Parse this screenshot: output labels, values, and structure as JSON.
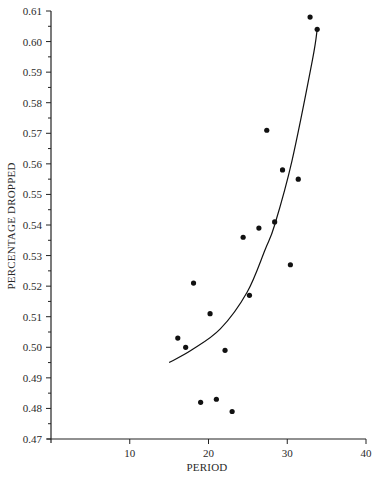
{
  "chart_data": {
    "type": "scatter",
    "title": "",
    "xlabel": "PERIOD",
    "ylabel": "PERCENTAGE DROPPED",
    "xlim": [
      0,
      40
    ],
    "ylim": [
      0.47,
      0.61
    ],
    "x_ticks": [
      10,
      20,
      30,
      40
    ],
    "x_tick_labels": [
      "10",
      "20",
      "30",
      "40"
    ],
    "y_ticks": [
      0.47,
      0.48,
      0.49,
      0.5,
      0.51,
      0.52,
      0.53,
      0.54,
      0.55,
      0.56,
      0.57,
      0.58,
      0.59,
      0.6,
      0.61
    ],
    "y_tick_labels": [
      "0.47",
      "0.48",
      "0.49",
      "0.50",
      "0.51",
      "0.52",
      "0.53",
      "0.54",
      "0.55",
      "0.56",
      "0.57",
      "0.58",
      "0.59",
      "0.60",
      "0.61"
    ],
    "y_minor_step": 0.005,
    "grid": false,
    "legend": null,
    "series": [
      {
        "name": "observations",
        "type": "scatter",
        "color": "#111111",
        "points": [
          {
            "x": 16.1,
            "y": 0.503
          },
          {
            "x": 17.1,
            "y": 0.5
          },
          {
            "x": 18.1,
            "y": 0.521
          },
          {
            "x": 19.0,
            "y": 0.482
          },
          {
            "x": 20.2,
            "y": 0.511
          },
          {
            "x": 21.0,
            "y": 0.483
          },
          {
            "x": 22.1,
            "y": 0.499
          },
          {
            "x": 23.0,
            "y": 0.479
          },
          {
            "x": 24.4,
            "y": 0.536
          },
          {
            "x": 25.2,
            "y": 0.517
          },
          {
            "x": 26.4,
            "y": 0.539
          },
          {
            "x": 27.4,
            "y": 0.571
          },
          {
            "x": 28.4,
            "y": 0.541
          },
          {
            "x": 29.4,
            "y": 0.558
          },
          {
            "x": 30.4,
            "y": 0.527
          },
          {
            "x": 31.4,
            "y": 0.555
          },
          {
            "x": 32.9,
            "y": 0.608
          },
          {
            "x": 33.8,
            "y": 0.604
          }
        ]
      },
      {
        "name": "fitted curve",
        "type": "line",
        "color": "#111111",
        "points": [
          {
            "x": 15.0,
            "y": 0.495
          },
          {
            "x": 17.8,
            "y": 0.499
          },
          {
            "x": 21.5,
            "y": 0.506
          },
          {
            "x": 24.9,
            "y": 0.518
          },
          {
            "x": 27.2,
            "y": 0.532
          },
          {
            "x": 28.4,
            "y": 0.54
          },
          {
            "x": 30.6,
            "y": 0.561
          },
          {
            "x": 33.2,
            "y": 0.594
          },
          {
            "x": 33.8,
            "y": 0.604
          }
        ]
      }
    ]
  }
}
